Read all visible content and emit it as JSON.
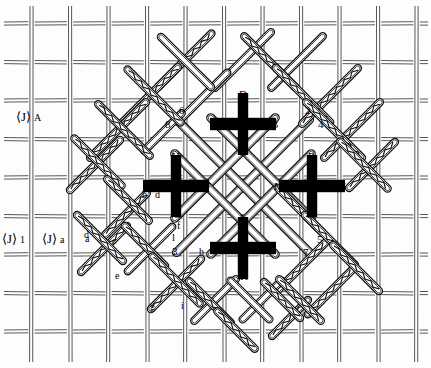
{
  "figure": {
    "type": "technical-diagram",
    "background_color": "#fdfdfd",
    "line_color": "#1a1a1a",
    "marker_color": "#000000",
    "width": 431,
    "height": 368
  },
  "axis_labels": [
    {
      "id": "axis-a",
      "bracket": "⟨J⟩",
      "dot": "·",
      "sub": "A",
      "x": 16,
      "y": 110
    },
    {
      "id": "axis-1",
      "bracket": "⟨J⟩",
      "dot": "·",
      "sub": "1",
      "x": 2,
      "y": 232
    },
    {
      "id": "axis-a2",
      "bracket": "⟨J⟩",
      "dot": "·",
      "sub": "a",
      "x": 42,
      "y": 232
    }
  ],
  "crosses": [
    {
      "id": "cross-top",
      "cx": 243,
      "cy": 124,
      "labels": {
        "left": "A",
        "right": "B",
        "top": "D",
        "bottom": "C"
      }
    },
    {
      "id": "cross-left",
      "cx": 176,
      "cy": 186,
      "labels": {
        "left": "E",
        "right": "F",
        "top": "H",
        "bottom": "G"
      }
    },
    {
      "id": "cross-right",
      "cx": 312,
      "cy": 186,
      "labels": {
        "left": "M",
        "right": "N",
        "top": "P",
        "bottom": "O"
      }
    },
    {
      "id": "cross-bottom",
      "cx": 243,
      "cy": 248,
      "labels": {
        "left": "I",
        "right": "J",
        "top": "L",
        "bottom": "K"
      }
    }
  ],
  "cross_labels": [
    {
      "text": "D",
      "x": 239,
      "y": 89,
      "cls": "cap"
    },
    {
      "text": "A",
      "x": 210,
      "y": 119,
      "cls": "cap"
    },
    {
      "text": "B",
      "x": 271,
      "y": 119,
      "cls": "cap"
    },
    {
      "text": "C",
      "x": 239,
      "y": 147,
      "cls": "cap"
    },
    {
      "text": "H",
      "x": 172,
      "y": 151,
      "cls": "cap"
    },
    {
      "text": "E",
      "x": 143,
      "y": 181,
      "cls": "cap"
    },
    {
      "text": "F",
      "x": 205,
      "y": 181,
      "cls": "cap"
    },
    {
      "text": "G",
      "x": 173,
      "y": 209,
      "cls": "cap"
    },
    {
      "text": "P",
      "x": 308,
      "y": 151,
      "cls": "cap"
    },
    {
      "text": "M",
      "x": 274,
      "y": 181,
      "cls": "cap"
    },
    {
      "text": "N",
      "x": 338,
      "y": 181,
      "cls": "cap"
    },
    {
      "text": "O",
      "x": 309,
      "y": 209,
      "cls": "cap"
    },
    {
      "text": "L",
      "x": 240,
      "y": 213,
      "cls": "cap"
    },
    {
      "text": "I",
      "x": 213,
      "y": 243,
      "cls": "cap"
    },
    {
      "text": "J",
      "x": 272,
      "y": 243,
      "cls": "cap"
    },
    {
      "text": "K",
      "x": 240,
      "y": 271,
      "cls": "cap"
    }
  ],
  "number_labels": [
    {
      "text": "6",
      "x": 179,
      "y": 105,
      "cls": "num"
    },
    {
      "text": "8",
      "x": 165,
      "y": 119,
      "cls": "num"
    },
    {
      "text": "2",
      "x": 305,
      "y": 105,
      "cls": "num"
    },
    {
      "text": "4",
      "x": 318,
      "y": 119,
      "cls": "num"
    },
    {
      "text": "3",
      "x": 172,
      "y": 246,
      "cls": "num"
    },
    {
      "text": "l",
      "x": 172,
      "y": 232,
      "cls": "num"
    },
    {
      "text": "5",
      "x": 317,
      "y": 234,
      "cls": "num"
    },
    {
      "text": "7",
      "x": 303,
      "y": 247,
      "cls": "num"
    }
  ],
  "lowercase_labels": [
    {
      "text": "b",
      "x": 142,
      "y": 190,
      "cls": "low"
    },
    {
      "text": "d",
      "x": 155,
      "y": 190,
      "cls": "low"
    },
    {
      "text": "f",
      "x": 177,
      "y": 221,
      "cls": "low"
    },
    {
      "text": "h",
      "x": 199,
      "y": 247,
      "cls": "low"
    },
    {
      "text": "a",
      "x": 85,
      "y": 234,
      "cls": "low"
    },
    {
      "text": "c",
      "x": 112,
      "y": 236,
      "cls": "low"
    },
    {
      "text": "d",
      "x": 84,
      "y": 230,
      "cls": "low"
    },
    {
      "text": "e",
      "x": 115,
      "y": 271,
      "cls": "low"
    },
    {
      "text": "g",
      "x": 150,
      "y": 302,
      "cls": "low"
    },
    {
      "text": "i",
      "x": 181,
      "y": 301,
      "cls": "low"
    }
  ]
}
